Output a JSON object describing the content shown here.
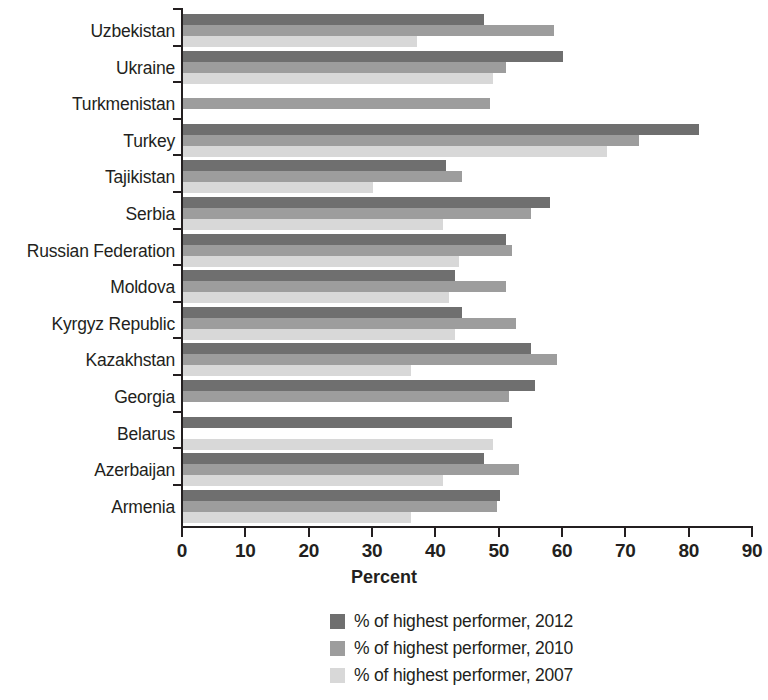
{
  "chart_data": {
    "type": "bar",
    "orientation": "horizontal",
    "title": "",
    "xlabel": "Percent",
    "ylabel": "",
    "xlim": [
      0,
      90
    ],
    "xticks": [
      0,
      10,
      20,
      30,
      40,
      50,
      60,
      70,
      80,
      90
    ],
    "grid": false,
    "legend_position": "bottom",
    "categories": [
      "Uzbekistan",
      "Ukraine",
      "Turkmenistan",
      "Turkey",
      "Tajikistan",
      "Serbia",
      "Russian Federation",
      "Moldova",
      "Kyrgyz Republic",
      "Kazakhstan",
      "Georgia",
      "Belarus",
      "Azerbaijan",
      "Armenia"
    ],
    "series": [
      {
        "name": "% of highest performer, 2012",
        "color": "#6f6f6f",
        "values": [
          47.5,
          60.0,
          null,
          81.5,
          41.5,
          58.0,
          51.0,
          43.0,
          44.0,
          55.0,
          55.5,
          52.0,
          47.5,
          50.0
        ]
      },
      {
        "name": "% of highest performer, 2010",
        "color": "#9d9d9d",
        "values": [
          58.5,
          51.0,
          48.5,
          72.0,
          44.0,
          55.0,
          52.0,
          51.0,
          52.5,
          59.0,
          51.5,
          null,
          53.0,
          49.5
        ]
      },
      {
        "name": "% of highest performer, 2007",
        "color": "#d8d8d8",
        "values": [
          37.0,
          49.0,
          null,
          67.0,
          30.0,
          41.0,
          43.5,
          42.0,
          43.0,
          36.0,
          null,
          49.0,
          41.0,
          36.0
        ]
      }
    ]
  },
  "legend": {
    "items": [
      {
        "label": "% of highest performer, 2012",
        "key": "s2012"
      },
      {
        "label": "% of highest performer, 2010",
        "key": "s2010"
      },
      {
        "label": "% of highest performer, 2007",
        "key": "s2007"
      }
    ]
  },
  "axis": {
    "x_title": "Percent",
    "tick_labels": [
      "0",
      "10",
      "20",
      "30",
      "40",
      "50",
      "60",
      "70",
      "80",
      "90"
    ]
  }
}
